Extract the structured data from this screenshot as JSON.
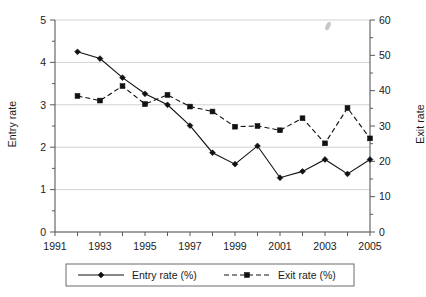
{
  "chart_data": {
    "type": "line",
    "title": "",
    "subtitle": "",
    "xlabel": "",
    "ylabel": "Entry rate",
    "y2label": "Exit rate",
    "x": [
      1992,
      1993,
      1994,
      1995,
      1996,
      1997,
      1998,
      1999,
      2000,
      2001,
      2002,
      2003,
      2004,
      2005
    ],
    "xlim": [
      1991,
      2005
    ],
    "ylim": [
      0,
      5
    ],
    "y2lim": [
      0,
      60
    ],
    "grid": true,
    "legend_position": "bottom",
    "series": [
      {
        "name": "Entry rate (%)",
        "axis": "left",
        "marker": "diamond",
        "linestyle": "solid",
        "color": "#111111",
        "values": [
          4.25,
          4.09,
          3.64,
          3.26,
          3.0,
          2.51,
          1.87,
          1.6,
          2.03,
          1.28,
          1.43,
          1.71,
          1.37,
          1.71
        ]
      },
      {
        "name": "Exit rate (%)",
        "axis": "right",
        "marker": "square",
        "linestyle": "dashed",
        "color": "#111111",
        "values": [
          38.5,
          37.2,
          41.3,
          36.2,
          38.8,
          35.5,
          34.1,
          29.8,
          30.0,
          28.8,
          32.2,
          25.1,
          35.1,
          26.5
        ]
      }
    ],
    "left_axis_ticks": [
      "0",
      "1",
      "2",
      "3",
      "4",
      "5"
    ],
    "right_axis_ticks": [
      "0",
      "10",
      "20",
      "30",
      "40",
      "50",
      "60"
    ],
    "x_axis_ticks": [
      "1991",
      "1993",
      "1995",
      "1997",
      "1999",
      "2001",
      "2003",
      "2005"
    ]
  },
  "axes": {
    "left_title": "Entry rate",
    "right_title": "Exit rate"
  },
  "legend": {
    "entries": [
      {
        "label": "Entry rate (%)"
      },
      {
        "label": "Exit rate (%)"
      }
    ]
  }
}
